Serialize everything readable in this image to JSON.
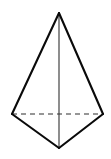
{
  "figure": {
    "shape_name": "pyramid",
    "background_color": "#ffffff",
    "canvas": {
      "width": 111,
      "height": 159
    },
    "colors": {
      "visible_edge": "#0a0a0a",
      "hidden_edge": "#2e2e2e",
      "front_lateral_edge": "#3a3a3a",
      "face": "#ffffff"
    },
    "stroke_widths": {
      "visible_edge": 2.1,
      "hidden_edge": 1.15,
      "front_lateral_edge": 1.15
    },
    "dash_pattern": "5 4",
    "vertices": {
      "apex": {
        "name": "apex",
        "x": 59,
        "y": 13
      },
      "left": {
        "name": "base-left",
        "x": 12,
        "y": 114
      },
      "right": {
        "name": "base-right",
        "x": 103,
        "y": 114
      },
      "front": {
        "name": "base-front",
        "x": 59,
        "y": 148
      }
    },
    "edges": [
      {
        "name": "apex-to-left",
        "from": "apex",
        "to": "left",
        "style": "solid",
        "points": "59,13 12,114"
      },
      {
        "name": "apex-to-right",
        "from": "apex",
        "to": "right",
        "style": "solid",
        "points": "59,13 103,114"
      },
      {
        "name": "left-to-front",
        "from": "left",
        "to": "front",
        "style": "solid",
        "points": "12,114 59,148"
      },
      {
        "name": "right-to-front",
        "from": "right",
        "to": "front",
        "style": "solid",
        "points": "103,114 59,148"
      },
      {
        "name": "apex-to-front",
        "from": "apex",
        "to": "front",
        "style": "thin",
        "points": "59,13 59,148"
      },
      {
        "name": "left-to-right",
        "from": "left",
        "to": "right",
        "style": "dashed",
        "points": "12,114 103,114"
      }
    ],
    "outline_path": "59,13 103,114 59,148 12,114"
  }
}
